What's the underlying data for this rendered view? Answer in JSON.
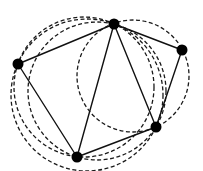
{
  "diagram": {
    "type": "delaunay-triangulation-with-circumcircles",
    "width": 203,
    "height": 171,
    "colors": {
      "background": "#ffffff",
      "edge": "#111111",
      "node": "#000000",
      "circle": "#1a1a1a"
    },
    "nodes": [
      {
        "id": "T",
        "x": 114,
        "y": 24,
        "r": 5.5
      },
      {
        "id": "L",
        "x": 18,
        "y": 64,
        "r": 5.5
      },
      {
        "id": "R",
        "x": 182,
        "y": 50,
        "r": 5.5
      },
      {
        "id": "BR",
        "x": 156,
        "y": 127,
        "r": 5.5
      },
      {
        "id": "B",
        "x": 77,
        "y": 157,
        "r": 5.5
      }
    ],
    "edges": [
      {
        "from": "L",
        "to": "T"
      },
      {
        "from": "L",
        "to": "B"
      },
      {
        "from": "T",
        "to": "B"
      },
      {
        "from": "T",
        "to": "BR"
      },
      {
        "from": "T",
        "to": "R"
      },
      {
        "from": "R",
        "to": "BR"
      },
      {
        "from": "B",
        "to": "BR"
      }
    ],
    "circles": [
      {
        "through": [
          "L",
          "T",
          "B"
        ],
        "cx": 84,
        "cy": 87,
        "r": 70
      },
      {
        "through": [
          "T",
          "B",
          "BR"
        ],
        "cx": 97,
        "cy": 91,
        "r": 69
      },
      {
        "through": [
          "T",
          "R",
          "BR"
        ],
        "cx": 133,
        "cy": 76,
        "r": 56
      },
      {
        "through": [
          "L",
          "T",
          "BR"
        ],
        "cx": 87,
        "cy": 95,
        "r": 76
      }
    ]
  }
}
